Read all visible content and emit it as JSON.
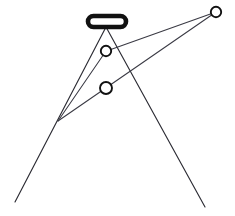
{
  "figure": {
    "title": "",
    "background_color": "#ffffff",
    "width": 235,
    "height": 216
  },
  "style": {
    "ray_color": "#3a3a44",
    "ray_dark_color": "#2b2b33",
    "node_stroke_color": "#111111",
    "node_fill_color": "#ffffff",
    "bar_stroke_color": "#111111",
    "bar_fill_color": "#ffffff"
  },
  "elements": {
    "bar": {
      "name": "lens-bar",
      "shape": "rounded-rectangle",
      "x": 88,
      "y": 16,
      "width": 38,
      "height": 11,
      "corner_radius": 5.5,
      "stroke_width": 4.6
    },
    "nodes": [
      {
        "name": "upper-node",
        "cx": 106,
        "cy": 51,
        "r": 5.2,
        "stroke_width": 1.9
      },
      {
        "name": "lower-node",
        "cx": 106,
        "cy": 88,
        "r": 6.0,
        "stroke_width": 1.9
      },
      {
        "name": "right-node",
        "cx": 216,
        "cy": 12,
        "r": 5.2,
        "stroke_width": 1.9
      }
    ],
    "vertex": {
      "name": "left-convergence-vertex",
      "x": 58,
      "y": 121
    },
    "rays": [
      {
        "name": "ray-bar-to-lower-left",
        "x1": 106,
        "y1": 27,
        "x2": 15,
        "y2": 202,
        "weight": "dark"
      },
      {
        "name": "ray-bar-to-lower-right",
        "x1": 106,
        "y1": 27,
        "x2": 205,
        "y2": 207,
        "weight": "dark"
      },
      {
        "name": "ray-vertex-to-upper-node",
        "x1": 58,
        "y1": 121,
        "x2": 106,
        "y2": 51,
        "weight": "light"
      },
      {
        "name": "ray-upper-node-to-right-node",
        "x1": 101,
        "y1": 53,
        "x2": 216,
        "y2": 12,
        "weight": "light"
      },
      {
        "name": "ray-vertex-to-right-node",
        "x1": 58,
        "y1": 121,
        "x2": 216,
        "y2": 12,
        "weight": "light"
      }
    ]
  }
}
